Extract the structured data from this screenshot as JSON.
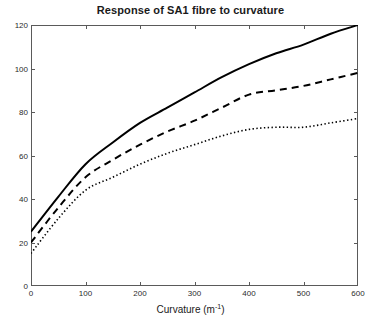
{
  "chart_data": {
    "type": "line",
    "title": "Response of SA1 fibre to curvature",
    "xlabel": "Curvature (m",
    "xlabel_sup": "-1",
    "xlabel_suffix": ")",
    "ylabel": "",
    "xlim": [
      0,
      600
    ],
    "ylim": [
      0,
      120
    ],
    "xticks": [
      0,
      100,
      200,
      300,
      400,
      500,
      600
    ],
    "yticks": [
      0,
      20,
      40,
      60,
      80,
      100,
      120
    ],
    "grid": false,
    "legend": "none",
    "x": [
      0,
      50,
      100,
      150,
      200,
      250,
      300,
      350,
      400,
      450,
      500,
      550,
      600
    ],
    "series": [
      {
        "name": "solid-curve",
        "style": "solid",
        "color": "#000000",
        "values": [
          25,
          41,
          56,
          66,
          75,
          82,
          89,
          96,
          102,
          107,
          111,
          116,
          120
        ]
      },
      {
        "name": "dashed-curve",
        "style": "dashed",
        "color": "#000000",
        "values": [
          20,
          36,
          50,
          58,
          65,
          71,
          76,
          82,
          88,
          90,
          92,
          95,
          98
        ]
      },
      {
        "name": "dotted-curve",
        "style": "dotted",
        "color": "#000000",
        "values": [
          15,
          31,
          44,
          50,
          56,
          61,
          65,
          69,
          72,
          73,
          73,
          75,
          77
        ]
      }
    ]
  },
  "axes": {
    "ytick_labels": [
      "0",
      "20",
      "40",
      "60",
      "80",
      "100",
      "120"
    ],
    "xtick_labels": [
      "0",
      "100",
      "200",
      "300",
      "400",
      "500",
      "600"
    ]
  },
  "colors": {
    "axis": "#5a5a5a",
    "text": "#1a1a1a",
    "line": "#000000",
    "background": "#ffffff"
  }
}
